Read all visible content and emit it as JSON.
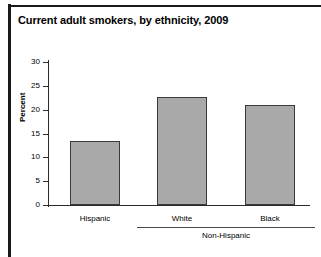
{
  "figure": {
    "title": "Current adult smokers, by ethnicity, 2009"
  },
  "chart_data": {
    "type": "bar",
    "title": "Current adult smokers, by ethnicity, 2009",
    "xlabel": "",
    "ylabel": "Percent",
    "categories": [
      "Hispanic",
      "White",
      "Black"
    ],
    "values": [
      13.4,
      22.6,
      21.0
    ],
    "ylim": [
      0,
      30
    ],
    "yticks": [
      0,
      5,
      10,
      15,
      20,
      25,
      30
    ],
    "ytick_labels": [
      "0",
      "5",
      "10",
      "15",
      "20",
      "25",
      "30"
    ],
    "grid": false,
    "legend": null,
    "bar_color": "#a9a9a9",
    "bar_edge_color": "#3a3a3a",
    "groups": [
      {
        "label": "Non-Hispanic",
        "categories": [
          "White",
          "Black"
        ]
      }
    ],
    "annotations": []
  }
}
